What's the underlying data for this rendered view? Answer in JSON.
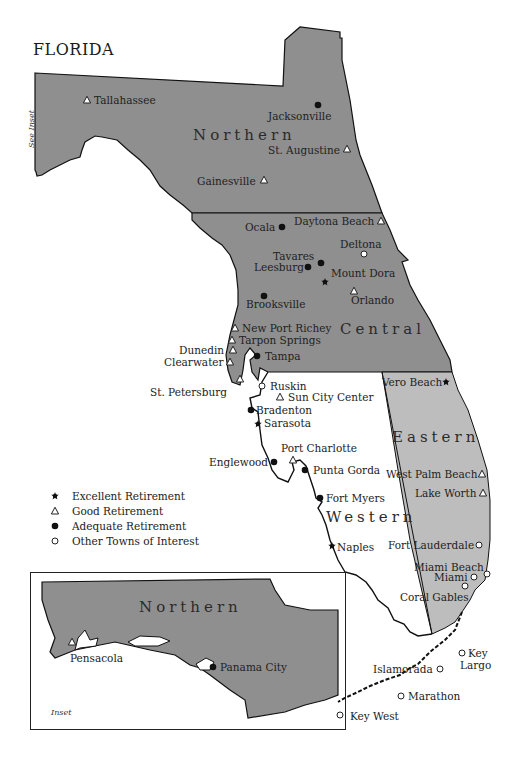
{
  "map": {
    "title": "FLORIDA",
    "see_inset_label": "See Inset",
    "regions": [
      {
        "name": "Northern",
        "color": "#8f8f8f"
      },
      {
        "name": "Central",
        "color": "#8f8f8f"
      },
      {
        "name": "Eastern",
        "color": "#bdbdbd"
      },
      {
        "name": "Western",
        "color": "#ffffff"
      }
    ],
    "cities": [
      {
        "name": "Tallahassee",
        "category": "good"
      },
      {
        "name": "Jacksonville",
        "category": "adequate"
      },
      {
        "name": "St. Augustine",
        "category": "good"
      },
      {
        "name": "Gainesville",
        "category": "good"
      },
      {
        "name": "Daytona Beach",
        "category": "good"
      },
      {
        "name": "Ocala",
        "category": "adequate"
      },
      {
        "name": "Deltona",
        "category": "other"
      },
      {
        "name": "Tavares",
        "category": "adequate"
      },
      {
        "name": "Leesburg",
        "category": "adequate"
      },
      {
        "name": "Mount Dora",
        "category": "excellent"
      },
      {
        "name": "Orlando",
        "category": "good"
      },
      {
        "name": "Brooksville",
        "category": "adequate"
      },
      {
        "name": "New Port Richey",
        "category": "good"
      },
      {
        "name": "Tarpon Springs",
        "category": "good"
      },
      {
        "name": "Dunedin",
        "category": "good"
      },
      {
        "name": "Clearwater",
        "category": "good"
      },
      {
        "name": "Tampa",
        "category": "adequate"
      },
      {
        "name": "St. Petersburg",
        "category": "good"
      },
      {
        "name": "Ruskin",
        "category": "other"
      },
      {
        "name": "Sun City Center",
        "category": "good"
      },
      {
        "name": "Vero Beach",
        "category": "excellent"
      },
      {
        "name": "Bradenton",
        "category": "adequate"
      },
      {
        "name": "Sarasota",
        "category": "excellent"
      },
      {
        "name": "Port Charlotte",
        "category": "good"
      },
      {
        "name": "Englewood",
        "category": "adequate"
      },
      {
        "name": "Punta Gorda",
        "category": "adequate"
      },
      {
        "name": "West Palm Beach",
        "category": "good"
      },
      {
        "name": "Lake Worth",
        "category": "good"
      },
      {
        "name": "Fort Myers",
        "category": "adequate"
      },
      {
        "name": "Naples",
        "category": "excellent"
      },
      {
        "name": "Fort Lauderdale",
        "category": "other"
      },
      {
        "name": "Miami Beach",
        "category": "other"
      },
      {
        "name": "Miami",
        "category": "other"
      },
      {
        "name": "Coral Gables",
        "category": "other"
      },
      {
        "name": "Key Largo",
        "category": "other"
      },
      {
        "name": "Islamorada",
        "category": "other"
      },
      {
        "name": "Marathon",
        "category": "other"
      },
      {
        "name": "Key West",
        "category": "other"
      }
    ],
    "labels": {
      "tallahassee": "Tallahassee",
      "jacksonville": "Jacksonville",
      "st_augustine": "St. Augustine",
      "gainesville": "Gainesville",
      "daytona_beach": "Daytona Beach",
      "ocala": "Ocala",
      "deltona": "Deltona",
      "tavares": "Tavares",
      "leesburg": "Leesburg",
      "mount_dora": "Mount Dora",
      "orlando": "Orlando",
      "brooksville": "Brooksville",
      "new_port_richey": "New Port Richey",
      "tarpon_springs": "Tarpon Springs",
      "dunedin": "Dunedin",
      "clearwater": "Clearwater",
      "tampa": "Tampa",
      "st_petersburg": "St. Petersburg",
      "ruskin": "Ruskin",
      "sun_city_center": "Sun City Center",
      "vero_beach": "Vero Beach",
      "bradenton": "Bradenton",
      "sarasota": "Sarasota",
      "port_charlotte": "Port Charlotte",
      "englewood": "Englewood",
      "punta_gorda": "Punta Gorda",
      "west_palm_beach": "West Palm Beach",
      "lake_worth": "Lake Worth",
      "fort_myers": "Fort Myers",
      "naples": "Naples",
      "fort_lauderdale": "Fort Lauderdale",
      "miami_beach": "Miami Beach",
      "miami": "Miami",
      "coral_gables": "Coral Gables",
      "key": "Key",
      "largo": "Largo",
      "islamorada": "Islamorada",
      "marathon": "Marathon",
      "key_west": "Key West"
    },
    "region_labels": {
      "northern": "Northern",
      "central": "Central",
      "eastern": "Eastern",
      "western": "Western"
    }
  },
  "legend": {
    "items": [
      {
        "symbol": "excellent-star",
        "label": "Excellent Retirement"
      },
      {
        "symbol": "good-triangle",
        "label": "Good Retirement"
      },
      {
        "symbol": "adequate-dot",
        "label": "Adequate Retirement"
      },
      {
        "symbol": "other-circle",
        "label": "Other Towns of Interest"
      }
    ]
  },
  "inset": {
    "region_label": "Northern",
    "caption": "Inset",
    "cities": [
      {
        "name": "Pensacola",
        "category": "good"
      },
      {
        "name": "Panama City",
        "category": "adequate"
      }
    ],
    "labels": {
      "pensacola": "Pensacola",
      "panama_city": "Panama City"
    }
  }
}
